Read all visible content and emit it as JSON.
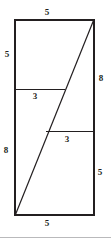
{
  "figure": {
    "kind": "geometry-diagram",
    "stroke_color": "#231f20",
    "background_color": "#ffffff",
    "rect": {
      "x": 15,
      "y": 20,
      "width": 79,
      "height": 195
    },
    "diagonal": {
      "x1": 15,
      "y1": 215,
      "x2": 94,
      "y2": 20
    },
    "upper_segment": {
      "x1": 15,
      "y1": 89,
      "x2": 65,
      "y2": 89
    },
    "lower_segment": {
      "x1": 46,
      "y1": 131,
      "x2": 94,
      "y2": 131
    },
    "baseline_rule": {
      "x1": 0,
      "y1": 237,
      "x2": 111,
      "y2": 237
    },
    "labels": {
      "top": "5",
      "bottom": "5",
      "left_upper": "5",
      "left_lower": "8",
      "right_upper": "8",
      "right_lower": "5",
      "middle_upper": "3",
      "middle_lower": "3"
    }
  }
}
